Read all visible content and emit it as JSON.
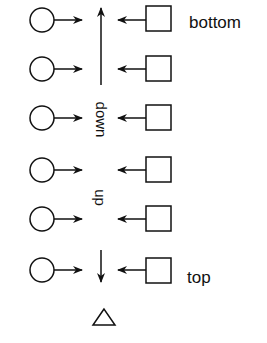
{
  "diagram": {
    "type": "stack",
    "rows": 6,
    "labels": {
      "bottom": "bottom",
      "top": "top",
      "down": "down",
      "up": "up"
    },
    "shapes": {
      "left": "circle",
      "right": "square",
      "base": "triangle"
    },
    "stroke_color": "#111111"
  }
}
